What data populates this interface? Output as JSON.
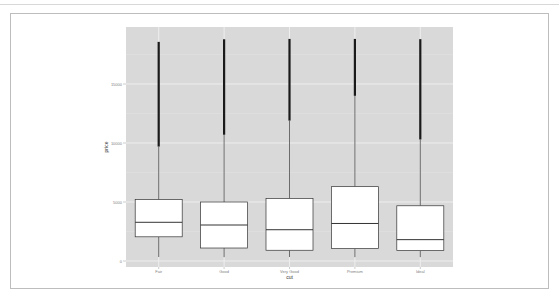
{
  "chart_data": {
    "type": "box",
    "title": "",
    "xlabel": "cut",
    "ylabel": "price",
    "categories": [
      "Fair",
      "Good",
      "Very Good",
      "Premium",
      "Ideal"
    ],
    "y_ticks": [
      0,
      5000,
      10000,
      15000
    ],
    "y_tick_labels": [
      "0",
      "5000",
      "10000",
      "15000"
    ],
    "ylim": [
      -600,
      19830
    ],
    "grid": true,
    "legend": "none",
    "series": [
      {
        "name": "Fair",
        "min": 337,
        "q1": 2050,
        "median": 3280,
        "q3": 5200,
        "whisker_high": 9700,
        "outlier_low": 9700,
        "outlier_high": 18570
      },
      {
        "name": "Good",
        "min": 327,
        "q1": 1100,
        "median": 3050,
        "q3": 5000,
        "whisker_high": 10700,
        "outlier_low": 10700,
        "outlier_high": 18790
      },
      {
        "name": "Very Good",
        "min": 336,
        "q1": 910,
        "median": 2650,
        "q3": 5300,
        "whisker_high": 11900,
        "outlier_low": 11900,
        "outlier_high": 18820
      },
      {
        "name": "Premium",
        "min": 326,
        "q1": 1050,
        "median": 3180,
        "q3": 6300,
        "whisker_high": 14000,
        "outlier_low": 14000,
        "outlier_high": 18820
      },
      {
        "name": "Ideal",
        "min": 326,
        "q1": 880,
        "median": 1810,
        "q3": 4680,
        "whisker_high": 10300,
        "outlier_low": 10300,
        "outlier_high": 18800
      }
    ]
  },
  "colors": {
    "panel": "#d9d9d9",
    "grid": "#eeeeee",
    "box_fill": "#ffffff",
    "box_line": "#333333",
    "outlier": "#1a1a1a"
  }
}
